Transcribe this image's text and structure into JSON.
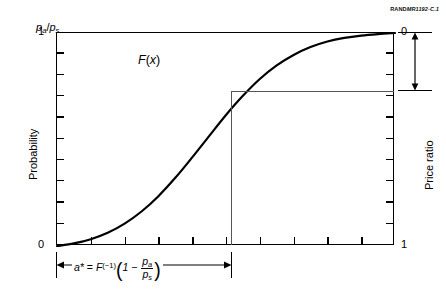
{
  "source_tag": {
    "bold": "RAND",
    "rest": "MR1192-C.1"
  },
  "figure": {
    "curve_label": "F",
    "curve_label_arg": "(x)",
    "left_axis": {
      "title": "Probability",
      "max_label": "1",
      "min_label": "0"
    },
    "right_axis": {
      "title": "Price ratio",
      "max_label": "0",
      "min_label": "1"
    },
    "right_annotation": {
      "p_symbol": "p",
      "sub_a": "a",
      "slash": "/",
      "p_symbol2": "p",
      "sub_s": "s"
    },
    "bottom_annotation": {
      "a_star": "a*",
      "equals": " = ",
      "F": "F",
      "inverse": "(−1)",
      "open_paren": "(",
      "one": "1",
      "minus": " − ",
      "num": "p",
      "num_sub": "a",
      "den": "p",
      "den_sub": "s",
      "close_paren": ")"
    }
  },
  "chart_data": {
    "type": "line",
    "title": "",
    "subtitle": "",
    "xlabel": "",
    "ylabel": "Probability",
    "y2label": "Price ratio",
    "xlim": [
      0,
      1
    ],
    "ylim": [
      0,
      1
    ],
    "y2lim": [
      1,
      0
    ],
    "grid": false,
    "legend": "none",
    "x_ticks": [
      0,
      0.1,
      0.2,
      0.3,
      0.4,
      0.5,
      0.6,
      0.7,
      0.8,
      0.9,
      1
    ],
    "x_tick_labels": [
      "0",
      "",
      "",
      "",
      "",
      "",
      "",
      "",
      "",
      "",
      "1"
    ],
    "y_ticks": [
      0,
      0.1,
      0.2,
      0.3,
      0.4,
      0.5,
      0.6,
      0.7,
      0.8,
      0.9,
      1
    ],
    "y_tick_labels": [
      "0",
      "",
      "",
      "",
      "",
      "",
      "",
      "",
      "",
      "",
      "1"
    ],
    "y2_ticks": [
      0,
      0.1,
      0.2,
      0.3,
      0.4,
      0.5,
      0.6,
      0.7,
      0.8,
      0.9,
      1
    ],
    "y2_tick_labels": [
      "0",
      "",
      "",
      "",
      "",
      "",
      "",
      "",
      "",
      "",
      "1"
    ],
    "series": [
      {
        "name": "F(x)",
        "kind": "cdf-sigmoid",
        "color": "#000000",
        "linewidth": 2.2,
        "x": [
          0.0,
          0.05,
          0.1,
          0.15,
          0.2,
          0.25,
          0.3,
          0.35,
          0.4,
          0.45,
          0.5,
          0.55,
          0.6,
          0.65,
          0.7,
          0.75,
          0.8,
          0.85,
          0.9,
          0.95,
          1.0
        ],
        "values": [
          0.0,
          0.012,
          0.032,
          0.062,
          0.105,
          0.162,
          0.234,
          0.32,
          0.416,
          0.516,
          0.615,
          0.705,
          0.784,
          0.848,
          0.897,
          0.934,
          0.96,
          0.977,
          0.988,
          0.995,
          1.0
        ]
      }
    ],
    "annotations": [
      {
        "name": "guide-horizontal",
        "kind": "hline-segment",
        "y": 0.715,
        "x_from": 0.52,
        "x_to": 1.0,
        "color": "#555555"
      },
      {
        "name": "guide-vertical",
        "kind": "vline-segment",
        "x": 0.52,
        "y_from": 0.0,
        "y_to": 0.715,
        "color": "#555555"
      },
      {
        "name": "price-ratio-span",
        "kind": "double-arrow-vertical",
        "from": 1.0,
        "to": 0.715,
        "label": "p_a/p_s"
      },
      {
        "name": "a-star-span",
        "kind": "double-arrow-horizontal",
        "from": 0.0,
        "to": 0.52,
        "label": "a* = F^(-1)(1 - p_a/p_s)"
      }
    ]
  }
}
